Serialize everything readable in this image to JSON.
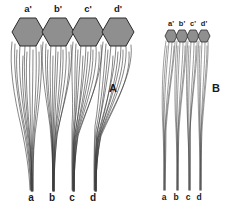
{
  "figure": {
    "background_color": "#ffffff",
    "ink_color": "#3a3a3a",
    "cell_fill_color": "#8f8f8f",
    "cell_stroke_color": "#2b2b2b",
    "panels": [
      {
        "id": "A",
        "letter": "A",
        "letter_x": 113,
        "letter_y": 92,
        "description": "wide divergent fiber pattern",
        "cells": [
          {
            "top_label": "a'",
            "bottom_label": "a",
            "top_label_x": 28,
            "top_label_y": 12,
            "bottom_label_x": 31,
            "bottom_label_y": 201,
            "hex_cx": 28,
            "hex_cy": 32,
            "root_x": 31
          },
          {
            "top_label": "b'",
            "bottom_label": "b",
            "top_label_x": 58,
            "top_label_y": 12,
            "bottom_label_x": 52,
            "bottom_label_y": 201,
            "hex_cx": 58,
            "hex_cy": 32,
            "root_x": 53
          },
          {
            "top_label": "c'",
            "bottom_label": "c",
            "top_label_x": 88,
            "top_label_y": 12,
            "bottom_label_x": 72,
            "bottom_label_y": 201,
            "hex_cx": 88,
            "hex_cy": 32,
            "root_x": 73
          },
          {
            "top_label": "d'",
            "bottom_label": "d",
            "top_label_x": 118,
            "top_label_y": 12,
            "bottom_label_x": 93,
            "bottom_label_y": 201,
            "hex_cx": 118,
            "hex_cy": 32,
            "root_x": 95
          }
        ]
      },
      {
        "id": "B",
        "letter": "B",
        "letter_x": 216,
        "letter_y": 92,
        "description": "narrow near-parallel fiber pattern",
        "cells": [
          {
            "top_label": "a'",
            "bottom_label": "a",
            "top_label_x": 171,
            "top_label_y": 25,
            "bottom_label_x": 164,
            "bottom_label_y": 200,
            "hex_cx": 171,
            "hex_cy": 36,
            "root_x": 164
          },
          {
            "top_label": "b'",
            "bottom_label": "b",
            "top_label_x": 182,
            "top_label_y": 25,
            "bottom_label_x": 176,
            "bottom_label_y": 200,
            "hex_cx": 182,
            "hex_cy": 36,
            "root_x": 177
          },
          {
            "top_label": "c'",
            "bottom_label": "c",
            "top_label_x": 193,
            "top_label_y": 25,
            "bottom_label_x": 188,
            "bottom_label_y": 200,
            "hex_cx": 193,
            "hex_cy": 36,
            "root_x": 189
          },
          {
            "top_label": "d'",
            "bottom_label": "d",
            "top_label_x": 204,
            "top_label_y": 25,
            "bottom_label_x": 199,
            "bottom_label_y": 200,
            "hex_cx": 204,
            "hex_cy": 36,
            "root_x": 200
          }
        ]
      }
    ]
  }
}
